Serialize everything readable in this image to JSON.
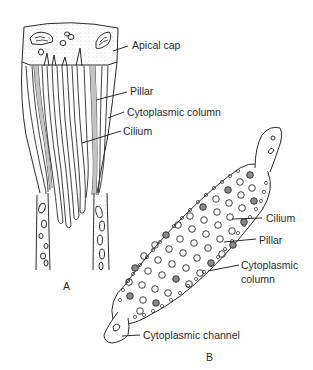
{
  "figure": {
    "panel_a": {
      "letter": "A",
      "labels": {
        "apical_cap": "Apical cap",
        "pillar": "Pillar",
        "cytoplasmic_column": "Cytoplasmic column",
        "cilium": "Cilium"
      }
    },
    "panel_b": {
      "letter": "B",
      "labels": {
        "cilium": "Cilium",
        "pillar": "Pillar",
        "cytoplasmic_column_line1": "Cytoplasmic",
        "cytoplasmic_column_line2": "column",
        "cytoplasmic_channel": "Cytoplasmic channel"
      }
    },
    "colors": {
      "line": "#2a2a2a",
      "stipple": "#b8b8b8",
      "pillar_fill": "#8a8a8a",
      "background": "#ffffff"
    }
  }
}
